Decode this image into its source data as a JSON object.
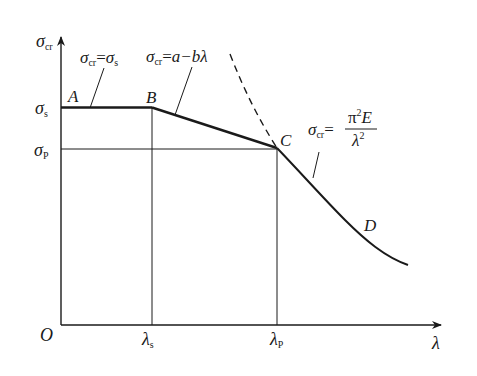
{
  "diagram": {
    "axes": {
      "y_label_main": "σ",
      "y_label_sub": "cr",
      "x_label": "λ",
      "origin_label": "O"
    },
    "y_ticks": [
      {
        "main": "σ",
        "sub": "s"
      },
      {
        "main": "σ",
        "sub": "P"
      }
    ],
    "x_ticks": [
      {
        "main": "λ",
        "sub": "s"
      },
      {
        "main": "λ",
        "sub": "P"
      }
    ],
    "points": {
      "A": "A",
      "B": "B",
      "C": "C",
      "D": "D"
    },
    "formulas": {
      "yield": {
        "lhs_main": "σ",
        "lhs_sub": "cr",
        "eq": "=",
        "rhs_main": "σ",
        "rhs_sub": "s"
      },
      "linear": {
        "lhs_main": "σ",
        "lhs_sub": "cr",
        "eq": "=",
        "rhs": "a−bλ"
      },
      "euler": {
        "lhs_main": "σ",
        "lhs_sub": "cr",
        "eq": "=",
        "numerator_pi": "π",
        "numerator_exp": "2",
        "numerator_E": "E",
        "denominator": "λ",
        "denominator_exp": "2"
      }
    },
    "colors": {
      "line": "#1a1a1a",
      "background": "#ffffff"
    }
  }
}
